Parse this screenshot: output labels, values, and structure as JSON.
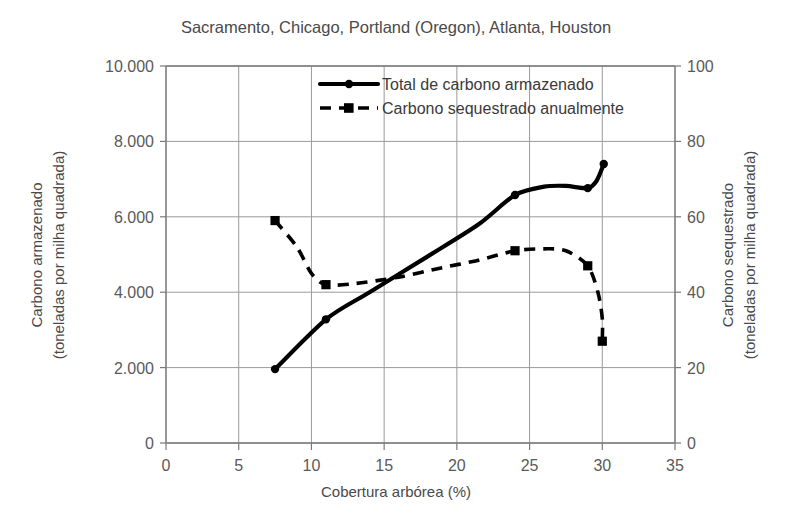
{
  "chart_data": {
    "type": "line",
    "title": "Sacramento, Chicago, Portland (Oregon), Atlanta, Houston",
    "xlabel": "Cobertura arbórea (%)",
    "ylabel": "Carbono armazenado",
    "ylabel_line2": "(toneladas por milha quadrada)",
    "y2label": "Carbono sequestrado",
    "y2label_line2": "(toneladas por milha quadrada)",
    "xlim": [
      0,
      35
    ],
    "ylim": [
      0,
      10000
    ],
    "y2lim": [
      0,
      100
    ],
    "xticks": [
      "0",
      "5",
      "10",
      "15",
      "20",
      "25",
      "30",
      "35"
    ],
    "xtick_values": [
      0,
      5,
      10,
      15,
      20,
      25,
      30,
      35
    ],
    "yticks": [
      "0",
      "2.000",
      "4.000",
      "6.000",
      "8.000",
      "10.000"
    ],
    "ytick_values": [
      0,
      2000,
      4000,
      6000,
      8000,
      10000
    ],
    "y2ticks": [
      "0",
      "20",
      "40",
      "60",
      "80",
      "100"
    ],
    "y2tick_values": [
      0,
      20,
      40,
      60,
      80,
      100
    ],
    "grid": true,
    "legend_position": "top-center",
    "series": [
      {
        "name": "Total de carbono armazenado",
        "axis": "left",
        "style": "solid",
        "marker": "circle",
        "x": [
          7.5,
          11,
          14,
          18,
          21.5,
          24,
          26,
          27.5,
          29,
          29.6,
          30.1
        ],
        "values": [
          1960,
          3280,
          4000,
          4950,
          5800,
          6580,
          6800,
          6820,
          6760,
          6950,
          7400
        ],
        "marker_points": [
          {
            "x": 7.5,
            "y": 1960
          },
          {
            "x": 11,
            "y": 3280
          },
          {
            "x": 24,
            "y": 6580
          },
          {
            "x": 29,
            "y": 6760
          },
          {
            "x": 30.1,
            "y": 7400
          }
        ]
      },
      {
        "name": "Carbono sequestrado anualmente",
        "axis": "right",
        "style": "dashed",
        "marker": "square",
        "x": [
          7.5,
          9,
          10,
          11,
          13,
          16,
          19,
          21.5,
          24,
          26,
          27.5,
          29,
          29.7,
          30,
          30
        ],
        "values": [
          59,
          52,
          45,
          42,
          42.3,
          44,
          46.5,
          48.5,
          51,
          51.5,
          51,
          47,
          40,
          33,
          27
        ],
        "marker_points": [
          {
            "x": 7.5,
            "y": 59
          },
          {
            "x": 11,
            "y": 42
          },
          {
            "x": 24,
            "y": 51
          },
          {
            "x": 29,
            "y": 47
          },
          {
            "x": 30,
            "y": 27
          }
        ]
      }
    ]
  },
  "legend": {
    "items": [
      {
        "label": "Total de carbono armazenado",
        "style": "solid",
        "marker": "circle"
      },
      {
        "label": "Carbono sequestrado anualmente",
        "style": "dashed",
        "marker": "square"
      }
    ]
  }
}
